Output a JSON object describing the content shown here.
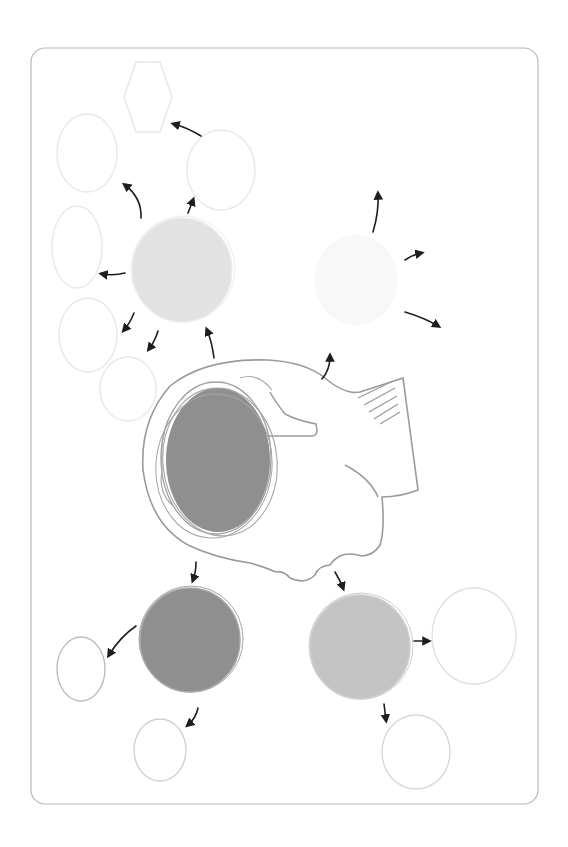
{
  "diagram": {
    "type": "mind-map-worksheet",
    "frame": {
      "x": 31,
      "y": 48,
      "width": 507,
      "height": 756,
      "radius": 14,
      "stroke": "#b8b8b8"
    },
    "colors": {
      "dark_fill": "#8f8f8f",
      "mid_fill": "#c4c4c4",
      "light_fill": "#e2e2e2",
      "faint_fill": "#f7f7f7",
      "outline_dark": "#a0a0a0",
      "outline_light": "#e6e6e6",
      "arrow": "#1e1e1e"
    },
    "head": {
      "label": "head-silhouette",
      "brain_fill": "#8f8f8f"
    },
    "nodes": [
      {
        "id": "top-left-hub",
        "cx": 182,
        "cy": 270,
        "rx": 50,
        "ry": 52,
        "fill": "#e2e2e2",
        "stroke": "#ededed"
      },
      {
        "id": "top-right-hub",
        "cx": 356,
        "cy": 280,
        "rx": 42,
        "ry": 45,
        "fill": "#f8f8f8",
        "stroke": "none"
      },
      {
        "id": "bottom-left-hub",
        "cx": 190,
        "cy": 640,
        "rx": 50,
        "ry": 52,
        "fill": "#8f8f8f",
        "stroke": "#a8a8a8"
      },
      {
        "id": "bottom-right-hub",
        "cx": 360,
        "cy": 647,
        "rx": 50,
        "ry": 52,
        "fill": "#c4c4c4",
        "stroke": "#cfcfcf"
      },
      {
        "id": "hexagon",
        "shape": "hexagon",
        "cx": 148,
        "cy": 97,
        "w": 48,
        "h": 70,
        "stroke": "#e6e6e6"
      },
      {
        "id": "tl-circle-1",
        "cx": 87,
        "cy": 153,
        "rx": 30,
        "ry": 39,
        "stroke": "#e8e8e8"
      },
      {
        "id": "tl-circle-2",
        "cx": 221,
        "cy": 170,
        "rx": 34,
        "ry": 40,
        "stroke": "#e8e8e8"
      },
      {
        "id": "tl-circle-3",
        "cx": 77,
        "cy": 247,
        "rx": 25,
        "ry": 41,
        "stroke": "#e8e8e8"
      },
      {
        "id": "tl-circle-4",
        "cx": 88,
        "cy": 335,
        "rx": 29,
        "ry": 37,
        "stroke": "#e8e8e8"
      },
      {
        "id": "tl-circle-5",
        "cx": 128,
        "cy": 389,
        "rx": 28,
        "ry": 32,
        "stroke": "#e8e8e8"
      },
      {
        "id": "bl-circle-1",
        "cx": 81,
        "cy": 669,
        "rx": 24,
        "ry": 32,
        "stroke": "#bdbdbd"
      },
      {
        "id": "bl-circle-2",
        "cx": 160,
        "cy": 750,
        "rx": 26,
        "ry": 31,
        "stroke": "#d0d0d0"
      },
      {
        "id": "br-circle-1",
        "cx": 474,
        "cy": 636,
        "rx": 42,
        "ry": 48,
        "stroke": "#e0e0e0"
      },
      {
        "id": "br-circle-2",
        "cx": 416,
        "cy": 752,
        "rx": 34,
        "ry": 37,
        "stroke": "#d8d8d8"
      }
    ],
    "arrows": [
      {
        "id": "head-to-tl-hub",
        "d": "M214,358 Q212,342 207,330"
      },
      {
        "id": "tl-hub-to-circle-1",
        "d": "M141,218 Q142,198 125,185"
      },
      {
        "id": "tl-hub-to-circle-2",
        "d": "M188,213 L193,200"
      },
      {
        "id": "tl-circle-2-to-hexagon",
        "d": "M201,136 Q188,128 174,124"
      },
      {
        "id": "tl-hub-to-circle-3",
        "d": "M125,273 Q114,276 102,274"
      },
      {
        "id": "tl-hub-to-circle-4",
        "d": "M134,313 Q130,323 124,330"
      },
      {
        "id": "tl-hub-to-circle-5",
        "d": "M158,331 Q155,341 149,349"
      },
      {
        "id": "head-to-tr-hub",
        "d": "M322,379 Q330,370 330,356"
      },
      {
        "id": "tr-hub-up",
        "d": "M373,232 Q379,212 378,194"
      },
      {
        "id": "tr-hub-right",
        "d": "M405,260 Q412,255 421,253"
      },
      {
        "id": "tr-hub-down-right",
        "d": "M405,312 Q425,318 438,326"
      },
      {
        "id": "head-to-bl-hub",
        "d": "M196,562 Q196,572 193,580"
      },
      {
        "id": "bl-hub-to-circle-1",
        "d": "M136,626 Q120,637 109,655"
      },
      {
        "id": "bl-hub-to-circle-2",
        "d": "M198,708 Q196,718 188,725"
      },
      {
        "id": "head-to-br-hub",
        "d": "M335,572 Q340,580 343,588"
      },
      {
        "id": "br-hub-to-circle-1",
        "d": "M414,641 L428,641"
      },
      {
        "id": "br-hub-to-circle-2",
        "d": "M384,704 L386,720"
      }
    ]
  }
}
